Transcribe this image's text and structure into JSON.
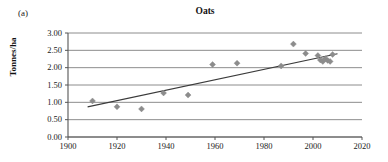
{
  "panel": {
    "label": "(a)"
  },
  "chart_data": {
    "type": "scatter",
    "title": "Oats",
    "xlabel": "",
    "ylabel": "Tonnes/ha",
    "xlim": [
      1900,
      2020
    ],
    "ylim": [
      0.0,
      3.0
    ],
    "xticks": [
      "1900",
      "1920",
      "1940",
      "1960",
      "1980",
      "2000",
      "2020"
    ],
    "xtick_values": [
      1900,
      1920,
      1940,
      1960,
      1980,
      2000,
      2020
    ],
    "yticks": [
      "0.00",
      "0.50",
      "1.00",
      "1.50",
      "2.00",
      "2.50",
      "3.00"
    ],
    "ytick_values": [
      0.0,
      0.5,
      1.0,
      1.5,
      2.0,
      2.5,
      3.0
    ],
    "grid": "horizontal",
    "legend": "none",
    "marker": "diamond",
    "marker_color": "#8c8c8c",
    "line_color": "#3b3b3b",
    "axis_color": "#808080",
    "points": [
      {
        "x": 1910,
        "y": 1.04
      },
      {
        "x": 1920,
        "y": 0.87
      },
      {
        "x": 1930,
        "y": 0.81
      },
      {
        "x": 1939,
        "y": 1.27
      },
      {
        "x": 1949,
        "y": 1.21
      },
      {
        "x": 1959,
        "y": 2.09
      },
      {
        "x": 1969,
        "y": 2.13
      },
      {
        "x": 1987,
        "y": 2.05
      },
      {
        "x": 1992,
        "y": 2.68
      },
      {
        "x": 1997,
        "y": 2.41
      },
      {
        "x": 2002,
        "y": 2.35
      },
      {
        "x": 2003,
        "y": 2.22
      },
      {
        "x": 2004,
        "y": 2.18
      },
      {
        "x": 2005,
        "y": 2.26
      },
      {
        "x": 2006,
        "y": 2.21
      },
      {
        "x": 2007,
        "y": 2.18
      },
      {
        "x": 2008,
        "y": 2.38
      }
    ],
    "trendline": {
      "x0": 1908,
      "y0": 0.87,
      "x1": 2010,
      "y1": 2.4
    }
  }
}
